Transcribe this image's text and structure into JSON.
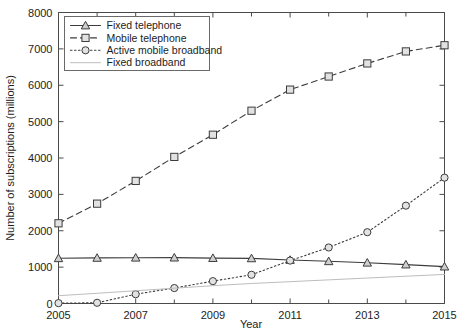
{
  "chart_data": {
    "type": "line",
    "title": "",
    "xlabel": "Year",
    "ylabel": "Number of subscriptions (millions)",
    "xlim": [
      2005,
      2015
    ],
    "ylim": [
      0,
      8000
    ],
    "grid": false,
    "legend_position": "upper left (inside axes)",
    "x_major_ticks": [
      2005,
      2007,
      2009,
      2011,
      2013,
      2015
    ],
    "x_minor_ticks": [
      2006,
      2008,
      2010,
      2012,
      2014
    ],
    "x_tick_labels": [
      "2005",
      "2007",
      "2009",
      "2011",
      "2013",
      "2015"
    ],
    "y_ticks": [
      0,
      1000,
      2000,
      3000,
      4000,
      5000,
      6000,
      7000,
      8000
    ],
    "y_tick_labels": [
      "0",
      "1000",
      "2000",
      "3000",
      "4000",
      "5000",
      "6000",
      "7000",
      "8000"
    ],
    "x": [
      2005,
      2006,
      2007,
      2008,
      2009,
      2010,
      2011,
      2012,
      2013,
      2014,
      2015
    ],
    "series": [
      {
        "name": "Fixed telephone",
        "values": [
          1243,
          1253,
          1258,
          1260,
          1248,
          1240,
          1196,
          1160,
          1120,
          1070,
          1013
        ],
        "color": "#3c3c3c",
        "linestyle": "solid",
        "marker": "triangle"
      },
      {
        "name": "Mobile telephone",
        "values": [
          2205,
          2745,
          3370,
          4030,
          4640,
          5300,
          5880,
          6240,
          6600,
          6930,
          7100
        ],
        "color": "#3c3c3c",
        "linestyle": "dashed",
        "marker": "square"
      },
      {
        "name": "Active mobile broadband",
        "values": [
          10,
          20,
          255,
          425,
          615,
          790,
          1180,
          1540,
          1960,
          2690,
          3460
        ],
        "color": "#3c3c3c",
        "linestyle": "dotted",
        "marker": "circle"
      },
      {
        "name": "Fixed broadband",
        "values": [
          215,
          280,
          350,
          420,
          490,
          550,
          600,
          650,
          700,
          750,
          800
        ],
        "color": "#bdbdbd",
        "linestyle": "solid",
        "marker": "none"
      }
    ]
  },
  "legend": {
    "entries": [
      {
        "label": "Fixed telephone"
      },
      {
        "label": "Mobile telephone"
      },
      {
        "label": "Active mobile broadband"
      },
      {
        "label": "Fixed broadband"
      }
    ]
  },
  "axes": {
    "x_title": "Year",
    "y_title": "Number of subscriptions (millions)"
  }
}
